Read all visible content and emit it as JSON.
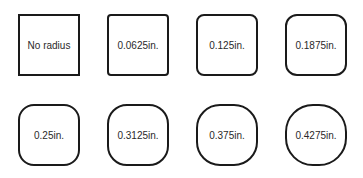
{
  "diagram": {
    "title": "",
    "boxes": [
      {
        "label": "No radius",
        "radius_px": 0
      },
      {
        "label": "0.0625in.",
        "radius_px": 4
      },
      {
        "label": "0.125in.",
        "radius_px": 8
      },
      {
        "label": "0.1875in.",
        "radius_px": 12
      },
      {
        "label": "0.25in.",
        "radius_px": 16
      },
      {
        "label": "0.3125in.",
        "radius_px": 20
      },
      {
        "label": "0.375in.",
        "radius_px": 24
      },
      {
        "label": "0.4275in.",
        "radius_px": 28
      }
    ],
    "colors": {
      "stroke": "#1a1a1a",
      "text": "#2a2a2a",
      "background": "#ffffff"
    }
  }
}
